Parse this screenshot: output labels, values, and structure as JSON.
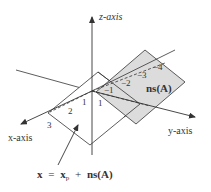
{
  "diagram": {
    "axes": {
      "z": "z-axis",
      "x": "x-axis",
      "y": "y-axis"
    },
    "planes": {
      "null_space": {
        "label": "ns(A)",
        "fill": "#dcdcdc"
      },
      "solution_set": {
        "label": "x = x_p + ns(A)",
        "fill": "#ffffff"
      }
    },
    "solution_label": {
      "x": "x",
      "eq": "=",
      "xp": "x",
      "sub": "p",
      "plus": "+",
      "ns": "ns(A)"
    },
    "gray_line_ticks": [
      "1",
      "−1",
      "−2",
      "−3",
      "−4"
    ],
    "white_line_ticks": [
      "1",
      "2",
      "3"
    ],
    "colors": {
      "line": "#333333",
      "gray_plane": "#dcdcdc",
      "background": "#ffffff"
    }
  }
}
